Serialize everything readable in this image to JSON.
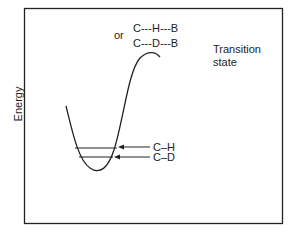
{
  "diagram": {
    "y_axis_label": "Energy",
    "transition_state": {
      "label_line1": "Transition",
      "label_line2": "state",
      "or_label": "or",
      "structure_h": "C---H---B",
      "structure_d": "C---D---B"
    },
    "levels": [
      {
        "label": "C–H"
      },
      {
        "label": "C–D"
      }
    ]
  }
}
